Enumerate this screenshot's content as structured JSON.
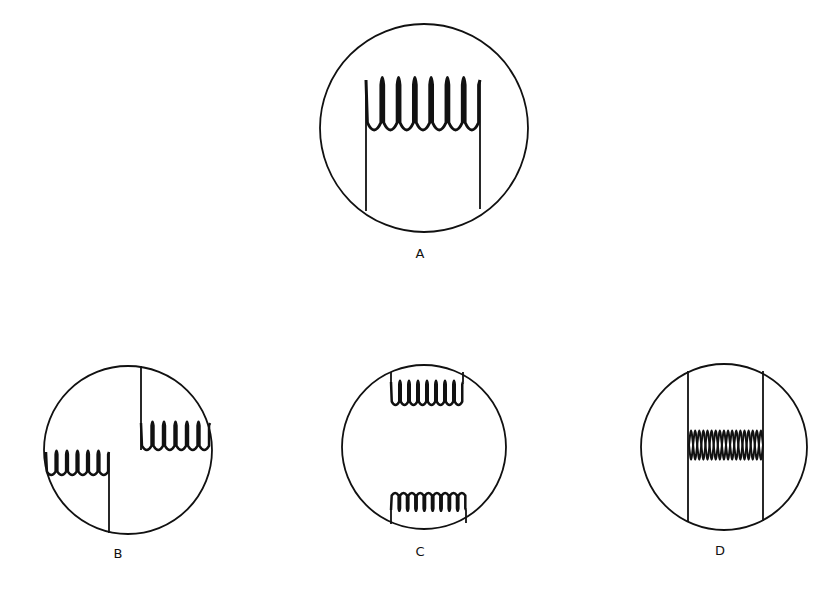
{
  "figure": {
    "background": "#ffffff",
    "stroke_color": "#111111",
    "panels": [
      {
        "id": "A",
        "label": "A",
        "circle": {
          "cx": 424,
          "cy": 128,
          "r": 104
        },
        "label_pos": {
          "x": 420,
          "y": 258
        },
        "coils": [
          {
            "x1": 366,
            "x2": 480,
            "y_top": 80,
            "y_bottom": 130,
            "loops": 7,
            "orientation": "down",
            "stroke": 3,
            "leads": [
              {
                "x": 366,
                "y1": 80,
                "y2": 211
              },
              {
                "x": 480,
                "y1": 80,
                "y2": 209
              }
            ]
          }
        ]
      },
      {
        "id": "B",
        "label": "B",
        "circle": {
          "cx": 128,
          "cy": 450,
          "r": 84
        },
        "label_pos": {
          "x": 118,
          "y": 558
        },
        "coils": [
          {
            "x1": 141,
            "x2": 210,
            "y_top": 423,
            "y_bottom": 450,
            "loops": 6,
            "orientation": "down",
            "stroke": 2.5,
            "leads": [
              {
                "x": 141,
                "y1": 366,
                "y2": 450
              }
            ]
          },
          {
            "x1": 46,
            "x2": 109,
            "y_top": 452,
            "y_bottom": 475,
            "loops": 6,
            "orientation": "down",
            "stroke": 2.5,
            "leads": [
              {
                "x": 109,
                "y1": 452,
                "y2": 533
              }
            ]
          }
        ]
      },
      {
        "id": "C",
        "label": "C",
        "circle": {
          "cx": 424,
          "cy": 447,
          "r": 82
        },
        "label_pos": {
          "x": 420,
          "y": 556
        },
        "coils": [
          {
            "x1": 391,
            "x2": 463,
            "y_top": 382,
            "y_bottom": 405,
            "loops": 8,
            "orientation": "down",
            "stroke": 2.5,
            "leads": [
              {
                "x": 391,
                "y1": 372,
                "y2": 382
              },
              {
                "x": 463,
                "y1": 372,
                "y2": 382
              }
            ]
          },
          {
            "x1": 391,
            "x2": 466,
            "y_top": 493,
            "y_bottom": 510,
            "loops": 9,
            "orientation": "up",
            "stroke": 2.5,
            "leads": [
              {
                "x": 391,
                "y1": 510,
                "y2": 524
              },
              {
                "x": 466,
                "y1": 510,
                "y2": 523
              }
            ]
          }
        ]
      },
      {
        "id": "D",
        "label": "D",
        "circle": {
          "cx": 724,
          "cy": 447,
          "r": 83
        },
        "label_pos": {
          "x": 720,
          "y": 555
        },
        "coils": [
          {
            "x1": 689,
            "x2": 763,
            "y_top": 430,
            "y_bottom": 460,
            "loops": 9,
            "orientation": "double",
            "stroke": 2,
            "leads": [
              {
                "x": 688,
                "y1": 371,
                "y2": 522
              },
              {
                "x": 763,
                "y1": 371,
                "y2": 521
              }
            ]
          }
        ]
      }
    ]
  }
}
